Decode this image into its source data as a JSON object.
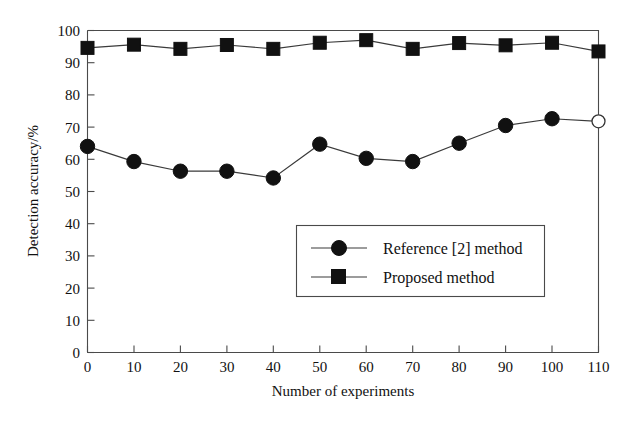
{
  "chart_data": {
    "type": "line",
    "title": "",
    "xlabel": "Number of experiments",
    "ylabel": "Detection accuracy/%",
    "xlim": [
      0,
      110
    ],
    "ylim": [
      0,
      100
    ],
    "xticks": [
      0,
      10,
      20,
      30,
      40,
      50,
      60,
      70,
      80,
      90,
      100,
      110
    ],
    "xtick_labels": [
      "0",
      "10",
      "20",
      "30",
      "40",
      "50",
      "60",
      "70",
      "80",
      "90",
      "100",
      "110"
    ],
    "yticks": [
      0,
      10,
      20,
      30,
      40,
      50,
      60,
      70,
      80,
      90,
      100
    ],
    "ytick_labels": [
      "0",
      "10",
      "20",
      "30",
      "40",
      "50",
      "60",
      "70",
      "80",
      "90",
      "100"
    ],
    "grid": false,
    "legend_position": "center-right-inside",
    "x": [
      0,
      10,
      20,
      30,
      40,
      50,
      60,
      70,
      80,
      90,
      100,
      110
    ],
    "series": [
      {
        "name": "Reference [2] method",
        "marker": "circle-filled",
        "last_marker": "circle-open",
        "color": "#111111",
        "values": [
          64.0,
          59.3,
          56.3,
          56.3,
          54.2,
          64.7,
          60.3,
          59.3,
          65.0,
          70.5,
          72.6,
          71.8
        ]
      },
      {
        "name": "Proposed method",
        "marker": "square-filled",
        "color": "#111111",
        "values": [
          94.6,
          95.6,
          94.3,
          95.5,
          94.3,
          96.2,
          97.0,
          94.3,
          96.1,
          95.4,
          96.2,
          93.5
        ]
      }
    ]
  },
  "legend": {
    "entries": [
      {
        "label": "Reference [2] method",
        "marker": "circle-filled"
      },
      {
        "label": "Proposed method",
        "marker": "square-filled"
      }
    ]
  }
}
